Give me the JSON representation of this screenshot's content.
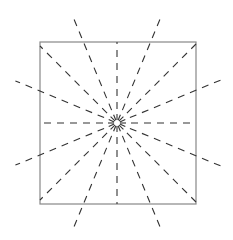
{
  "diagram": {
    "colors": {
      "square_stroke": "#888888",
      "ray_stroke": "#333333",
      "background": "#ffffff"
    },
    "square": {
      "x": 40,
      "y": 42,
      "width": 156,
      "height": 162
    },
    "center": {
      "x": 117,
      "y": 123
    },
    "ray_count": 16
  }
}
